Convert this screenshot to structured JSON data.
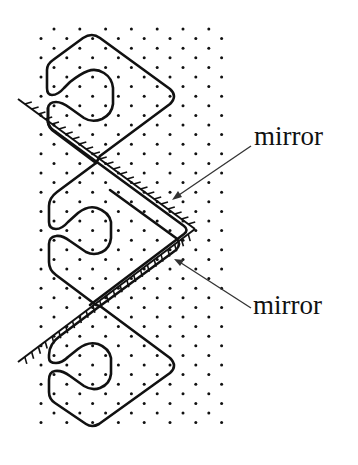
{
  "figure": {
    "labels": {
      "upper_mirror": "mirror",
      "lower_mirror": "mirror"
    },
    "colors": {
      "background": "#ffffff",
      "ink": "#111111",
      "arrow": "#333333"
    },
    "field_dots": {
      "x_start": 41,
      "x_end": 224,
      "y_start": 29,
      "y_end": 431,
      "column_spacing": 25.8,
      "row_spacing": 9.6
    },
    "mirrors": [
      {
        "name": "upper",
        "from": [
          18,
          99
        ],
        "to": [
          195,
          229
        ],
        "hatch_side": "upper-right"
      },
      {
        "name": "lower",
        "from": [
          195,
          229
        ],
        "to": [
          18,
          362
        ],
        "hatch_side": "lower-right"
      }
    ],
    "arrows": [
      {
        "name": "upper",
        "from": [
          251,
          146
        ],
        "to": [
          172,
          200
        ]
      },
      {
        "name": "lower",
        "from": [
          251,
          308
        ],
        "to": [
          174,
          259
        ]
      }
    ]
  }
}
